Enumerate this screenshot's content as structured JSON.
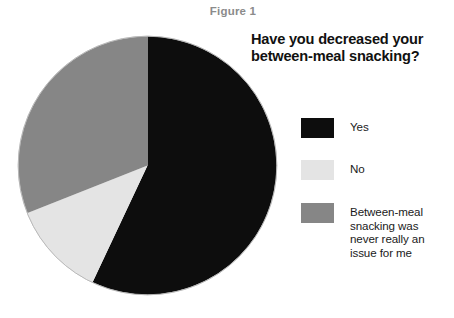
{
  "figure": {
    "label": "Figure 1",
    "top_artifact_text": "",
    "question_line1": "Have you decreased your",
    "question_line2": "between-meal snacking?"
  },
  "legend": {
    "items": [
      {
        "key": "yes",
        "swatch_name": "legend-swatch-yes",
        "color": "#0d0d0d",
        "lines": [
          "Yes"
        ]
      },
      {
        "key": "no",
        "swatch_name": "legend-swatch-no",
        "color": "#e4e4e4",
        "lines": [
          "No"
        ]
      },
      {
        "key": "never-an-issue",
        "swatch_name": "legend-swatch-never",
        "color": "#868686",
        "lines": [
          "Between-meal",
          "snacking was",
          "never really an",
          "issue for me"
        ]
      }
    ]
  },
  "chart_data": {
    "type": "pie",
    "title": "Figure 1",
    "subtitle": "Have you decreased your between-meal snacking?",
    "xlabel": "",
    "ylabel": "",
    "legend_position": "right",
    "grid": false,
    "start_angle_deg": 0,
    "direction": "clockwise",
    "categories": [
      "Yes",
      "No",
      "Between-meal snacking was never really an issue for me"
    ],
    "values": [
      57,
      12,
      31
    ],
    "units": "percent",
    "colors": [
      "#0d0d0d",
      "#e4e4e4",
      "#868686"
    ],
    "slices": [
      {
        "label": "Yes",
        "value": 57,
        "color": "#0d0d0d",
        "start_deg": 0,
        "end_deg": 205.2
      },
      {
        "label": "No",
        "value": 12,
        "color": "#e4e4e4",
        "start_deg": 205.2,
        "end_deg": 248.4
      },
      {
        "label": "Between-meal snacking was never really an issue for me",
        "value": 31,
        "color": "#868686",
        "start_deg": 248.4,
        "end_deg": 360
      }
    ],
    "geometry": {
      "center_x": 130.5,
      "center_y": 130.5,
      "radius": 129
    }
  }
}
